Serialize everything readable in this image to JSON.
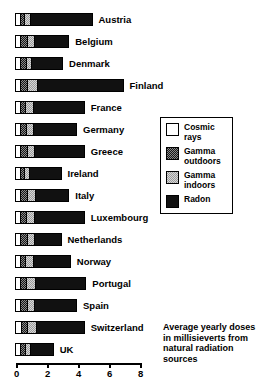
{
  "chart_data": {
    "type": "bar",
    "orientation": "horizontal",
    "stacked": true,
    "title": "Average yearly doses in millisieverts from natural radiation sources",
    "xlabel": "",
    "ylabel": "",
    "xlim": [
      0,
      8
    ],
    "xticks": [
      0,
      2,
      4,
      6,
      8
    ],
    "xtick_labels": [
      "0",
      "2",
      "4",
      "6",
      "8"
    ],
    "grid": false,
    "legend_position": "right",
    "units": "millisieverts per year",
    "series": [
      {
        "name": "Cosmic rays",
        "color": "#ffffff",
        "values": [
          0.3,
          0.3,
          0.3,
          0.3,
          0.35,
          0.3,
          0.3,
          0.35,
          0.3,
          0.3,
          0.3,
          0.3,
          0.3,
          0.3,
          0.4,
          0.3
        ]
      },
      {
        "name": "Gamma outdoors",
        "color": "#171717",
        "values": [
          0.25,
          0.45,
          0.4,
          0.45,
          0.3,
          0.4,
          0.45,
          0.25,
          0.45,
          0.4,
          0.45,
          0.35,
          0.4,
          0.45,
          0.35,
          0.35
        ]
      },
      {
        "name": "Gamma indoors",
        "color": "#d7d7d7",
        "values": [
          0.45,
          0.45,
          0.35,
          0.65,
          0.5,
          0.45,
          0.45,
          0.3,
          0.55,
          0.55,
          0.45,
          0.5,
          0.6,
          0.45,
          0.6,
          0.35
        ]
      },
      {
        "name": "Radon",
        "color": "#111111",
        "values": [
          4.0,
          2.3,
          2.05,
          5.6,
          3.35,
          2.85,
          3.3,
          2.1,
          2.2,
          3.25,
          1.8,
          2.45,
          3.3,
          2.8,
          3.15,
          1.5
        ]
      }
    ],
    "categories": [
      "Austria",
      "Belgium",
      "Denmark",
      "Finland",
      "France",
      "Germany",
      "Greece",
      "Ireland",
      "Italy",
      "Luxembourg",
      "Netherlands",
      "Norway",
      "Portugal",
      "Spain",
      "Switzerland",
      "UK"
    ],
    "totals": [
      5.0,
      3.5,
      3.1,
      7.0,
      4.5,
      4.0,
      4.5,
      3.0,
      3.5,
      4.5,
      3.0,
      3.6,
      4.6,
      4.0,
      4.5,
      2.5
    ]
  },
  "legend": {
    "items": [
      {
        "label_line1": "Cosmic",
        "label_line2": "rays",
        "swatch": "fill-cosmic"
      },
      {
        "label_line1": "Gamma",
        "label_line2": "outdoors",
        "swatch": "fill-gamma-out"
      },
      {
        "label_line1": "Gamma",
        "label_line2": "indoors",
        "swatch": "fill-gamma-in"
      },
      {
        "label_line1": "Radon",
        "label_line2": "",
        "swatch": "fill-radon"
      }
    ]
  },
  "caption": {
    "text": "Average yearly doses in millisieverts from natural radiation sources"
  }
}
